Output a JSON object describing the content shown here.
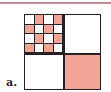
{
  "label": "a.",
  "colors": {
    "fill": "#f2a596",
    "empty": "#ffffff",
    "line": "#222222",
    "top_rule": "#c98a98"
  },
  "grid": {
    "rows": 4,
    "cols": 4,
    "cells": [
      [
        0,
        1,
        0,
        1
      ],
      [
        1,
        0,
        1,
        0
      ],
      [
        0,
        1,
        0,
        1
      ],
      [
        1,
        0,
        1,
        0
      ]
    ]
  },
  "quadrants": {
    "top_right": "empty",
    "bottom_left": "empty",
    "bottom_right": "filled"
  }
}
